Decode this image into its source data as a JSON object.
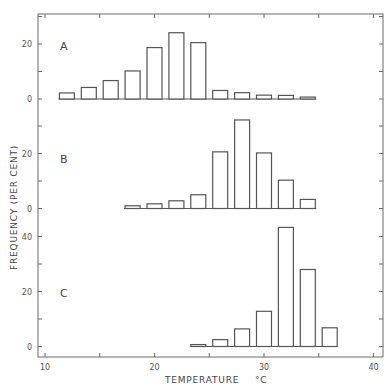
{
  "chart_data": {
    "type": "bar",
    "title": "",
    "xlabel": "TEMPERATURE °C",
    "ylabel": "FREQUENCY (PER CENT)",
    "xlim": [
      10,
      40
    ],
    "x_ticks": [
      10,
      20,
      30,
      40
    ],
    "x_minor_ticks": [
      10,
      15,
      20,
      25,
      30,
      35,
      40
    ],
    "bin_width": 2,
    "grid": false,
    "legend": null,
    "panels": [
      {
        "label": "A",
        "y_ticks": [
          0,
          20
        ],
        "ylim": [
          0,
          30
        ],
        "x": [
          12,
          14,
          16,
          18,
          20,
          22,
          24,
          26,
          28,
          30,
          32,
          34
        ],
        "values": [
          2.2,
          4.2,
          6.7,
          10.2,
          18.7,
          24.1,
          20.5,
          3.1,
          2.3,
          1.4,
          1.3,
          0.7
        ]
      },
      {
        "label": "B",
        "y_ticks": [
          0,
          20
        ],
        "ylim": [
          0,
          33
        ],
        "x": [
          18,
          20,
          22,
          24,
          26,
          28,
          30,
          32,
          34
        ],
        "values": [
          1.0,
          1.7,
          2.8,
          5.0,
          20.6,
          32.2,
          20.2,
          10.3,
          3.3
        ]
      },
      {
        "label": "C",
        "y_ticks": [
          0,
          20,
          40
        ],
        "ylim": [
          0,
          45
        ],
        "x": [
          24,
          26,
          28,
          30,
          32,
          34,
          36
        ],
        "values": [
          0.7,
          2.5,
          6.4,
          12.8,
          43.3,
          28.0,
          6.8
        ]
      }
    ]
  },
  "axes": {
    "xlabel_text": "TEMPERATURE",
    "xlabel_unit": "°C",
    "ylabel_text": "FREQUENCY  (PER  CENT)"
  }
}
